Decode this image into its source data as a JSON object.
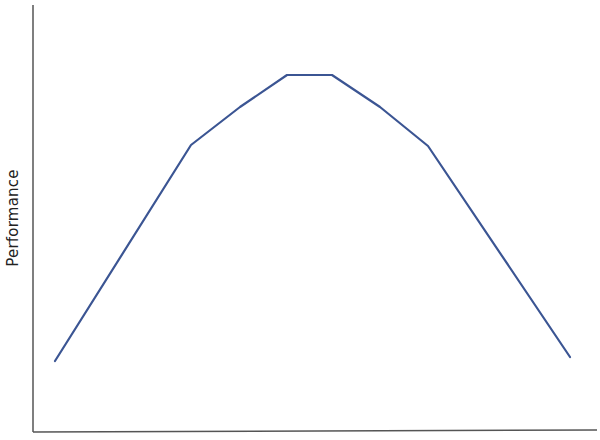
{
  "chart_data": {
    "type": "line",
    "title": "",
    "xlabel": "",
    "ylabel": "Performance",
    "grid": false,
    "legend": null,
    "x": [
      0,
      1,
      2,
      3,
      4,
      5,
      6,
      7
    ],
    "series": [
      {
        "name": "Performance",
        "color": "#3b5593",
        "values": [
          0.15,
          0.66,
          0.75,
          0.83,
          0.83,
          0.75,
          0.66,
          0.16
        ]
      }
    ],
    "xlim": [
      -0.16,
      7.2
    ],
    "ylim": [
      0,
      1
    ],
    "pixel_points": [
      [
        55,
        361
      ],
      [
        191,
        145
      ],
      [
        240,
        107
      ],
      [
        287,
        75
      ],
      [
        332,
        75
      ],
      [
        380,
        107
      ],
      [
        428,
        146
      ],
      [
        570,
        357
      ]
    ]
  },
  "axes": {
    "color": "#555555",
    "y_axis": {
      "x": 33,
      "y_top": 5,
      "y_bottom": 432
    },
    "x_axis": {
      "y": 432,
      "x_left": 33,
      "x_right": 597
    }
  }
}
